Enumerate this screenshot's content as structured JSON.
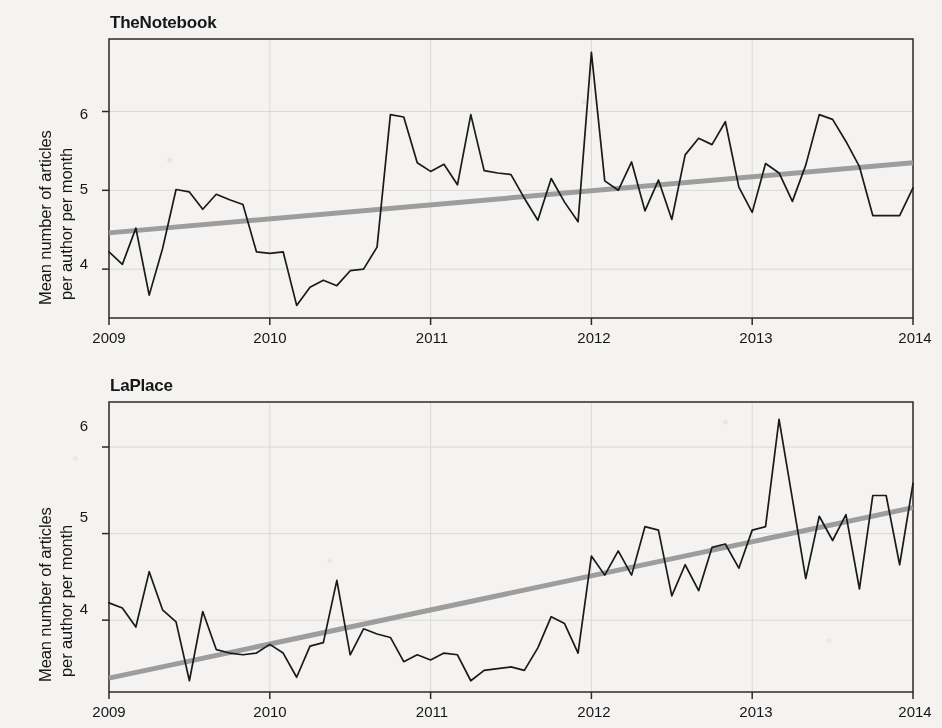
{
  "figure": {
    "background_color": "#f4f3f1",
    "series_color": "#1a1a1a",
    "trend_color": "#999999",
    "axis_color": "#2b2b2b",
    "grid_color": "#d8d6d2"
  },
  "panels": [
    {
      "title": "TheNotebook",
      "ylabel_line1": "Mean number of articles",
      "ylabel_line2": "per author per month",
      "ytick_labels": [
        "4",
        "5",
        "6"
      ],
      "xtick_labels": [
        "2009",
        "2010",
        "2011",
        "2012",
        "2013",
        "2014"
      ]
    },
    {
      "title": "LaPlace",
      "ylabel_line1": "Mean number of articles",
      "ylabel_line2": "per author per month",
      "ytick_labels": [
        "4",
        "5",
        "6"
      ],
      "xtick_labels": [
        "2009",
        "2010",
        "2011",
        "2012",
        "2013",
        "2014"
      ]
    }
  ],
  "chart_data": [
    {
      "type": "line",
      "title": "TheNotebook",
      "xlabel": "",
      "ylabel": "Mean number of articles per author per month",
      "xlim": [
        2009,
        2014
      ],
      "ylim": [
        3.38,
        6.92
      ],
      "xticks": [
        2009,
        2010,
        2011,
        2012,
        2013,
        2014
      ],
      "yticks": [
        4,
        5,
        6
      ],
      "grid": true,
      "legend": "none",
      "x": [
        2009.0,
        2009.083,
        2009.167,
        2009.25,
        2009.333,
        2009.417,
        2009.5,
        2009.583,
        2009.667,
        2009.75,
        2009.833,
        2009.917,
        2010.0,
        2010.083,
        2010.167,
        2010.25,
        2010.333,
        2010.417,
        2010.5,
        2010.583,
        2010.667,
        2010.75,
        2010.833,
        2010.917,
        2011.0,
        2011.083,
        2011.167,
        2011.25,
        2011.333,
        2011.417,
        2011.5,
        2011.583,
        2011.667,
        2011.75,
        2011.833,
        2011.917,
        2012.0,
        2012.083,
        2012.167,
        2012.25,
        2012.333,
        2012.417,
        2012.5,
        2012.583,
        2012.667,
        2012.75,
        2012.833,
        2012.917,
        2013.0,
        2013.083,
        2013.167,
        2013.25,
        2013.333,
        2013.417,
        2013.5,
        2013.583,
        2013.667,
        2013.75,
        2013.833,
        2013.917,
        2014.0
      ],
      "series": [
        {
          "name": "Mean articles per author per month",
          "style": "line",
          "values": [
            4.22,
            4.06,
            4.52,
            3.67,
            4.26,
            5.01,
            4.98,
            4.76,
            4.95,
            4.88,
            4.82,
            4.22,
            4.2,
            4.22,
            3.54,
            3.77,
            3.86,
            3.79,
            3.98,
            4.0,
            4.28,
            5.96,
            5.93,
            5.35,
            5.24,
            5.33,
            5.07,
            5.96,
            5.25,
            5.22,
            5.2,
            4.9,
            4.62,
            5.15,
            4.85,
            4.6,
            6.75,
            5.12,
            5.0,
            5.36,
            4.74,
            5.13,
            4.63,
            5.45,
            5.66,
            5.58,
            5.87,
            5.04,
            4.72,
            5.34,
            5.22,
            4.86,
            5.32,
            5.96,
            5.9,
            5.62,
            5.3,
            4.68,
            4.68,
            4.68,
            5.03
          ]
        },
        {
          "name": "Linear trend",
          "style": "trend",
          "values": [
            4.46,
            5.35
          ],
          "x_endpoints": [
            2009,
            2014
          ]
        }
      ]
    },
    {
      "type": "line",
      "title": "LaPlace",
      "xlabel": "",
      "ylabel": "Mean number of articles per author per month",
      "xlim": [
        2009,
        2014
      ],
      "ylim": [
        3.17,
        6.52
      ],
      "xticks": [
        2009,
        2010,
        2011,
        2012,
        2013,
        2014
      ],
      "yticks": [
        4,
        5,
        6
      ],
      "grid": true,
      "legend": "none",
      "x": [
        2009.0,
        2009.083,
        2009.167,
        2009.25,
        2009.333,
        2009.417,
        2009.5,
        2009.583,
        2009.667,
        2009.75,
        2009.833,
        2009.917,
        2010.0,
        2010.083,
        2010.167,
        2010.25,
        2010.333,
        2010.417,
        2010.5,
        2010.583,
        2010.667,
        2010.75,
        2010.833,
        2010.917,
        2011.0,
        2011.083,
        2011.167,
        2011.25,
        2011.333,
        2011.417,
        2011.5,
        2011.583,
        2011.667,
        2011.75,
        2011.833,
        2011.917,
        2012.0,
        2012.083,
        2012.167,
        2012.25,
        2012.333,
        2012.417,
        2012.5,
        2012.583,
        2012.667,
        2012.75,
        2012.833,
        2012.917,
        2013.0,
        2013.083,
        2013.167,
        2013.25,
        2013.333,
        2013.417,
        2013.5,
        2013.583,
        2013.667,
        2013.75,
        2013.833,
        2013.917,
        2014.0
      ],
      "series": [
        {
          "name": "Mean articles per author per month",
          "style": "line",
          "values": [
            4.2,
            4.14,
            3.92,
            4.56,
            4.12,
            3.98,
            3.3,
            4.1,
            3.66,
            3.62,
            3.6,
            3.62,
            3.72,
            3.62,
            3.34,
            3.7,
            3.74,
            4.46,
            3.6,
            3.9,
            3.84,
            3.8,
            3.52,
            3.6,
            3.54,
            3.62,
            3.6,
            3.3,
            3.42,
            3.44,
            3.46,
            3.42,
            3.68,
            4.04,
            3.96,
            3.62,
            4.74,
            4.52,
            4.8,
            4.52,
            5.08,
            5.04,
            4.28,
            4.64,
            4.34,
            4.84,
            4.88,
            4.6,
            5.04,
            5.08,
            6.32,
            5.4,
            4.48,
            5.2,
            4.92,
            5.22,
            4.36,
            5.44,
            5.44,
            4.64,
            5.58
          ]
        },
        {
          "name": "Linear trend",
          "style": "trend",
          "values": [
            3.33,
            5.3
          ],
          "x_endpoints": [
            2009,
            2014
          ]
        }
      ]
    }
  ]
}
